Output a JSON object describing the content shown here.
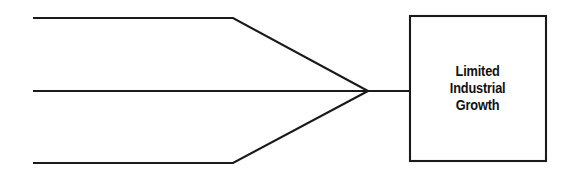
{
  "diagram": {
    "type": "convergence-flow-diagram",
    "background_color": "#ffffff",
    "line_color": "#1a1a1a",
    "text_color": "#111111",
    "outcome_node": {
      "label_line_1": "Limited",
      "label_line_2": "Industrial",
      "label_line_3": "Growth",
      "label_full": "Limited Industrial Growth",
      "shape": "rectangle",
      "fill": "#ffffff",
      "border_color": "#1a1a1a"
    },
    "input_branches": [
      {
        "id": "branch-top",
        "label": ""
      },
      {
        "id": "branch-middle",
        "label": ""
      },
      {
        "id": "branch-bottom",
        "label": ""
      }
    ],
    "geometry": {
      "branch_start_x": 33,
      "branch_top_y": 18,
      "branch_middle_y": 91,
      "branch_bottom_y": 163,
      "bend_x": 233,
      "converge_x": 368,
      "converge_y": 91,
      "box_left": 409,
      "box_top": 15,
      "box_width": 138,
      "box_height": 147
    }
  }
}
